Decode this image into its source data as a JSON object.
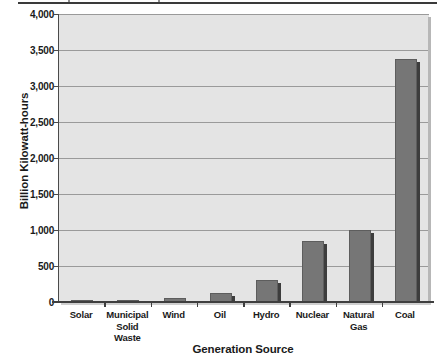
{
  "chart_data": {
    "type": "bar",
    "title": "",
    "xlabel": "Generation Source",
    "ylabel": "Billion Kilowatt-hours",
    "categories": [
      "Solar",
      "Municipal Solid Waste",
      "Wind",
      "Oil",
      "Hydro",
      "Nuclear",
      "Natural Gas",
      "Coal"
    ],
    "category_lines": [
      [
        "Solar"
      ],
      [
        "Municipal",
        "Solid Waste"
      ],
      [
        "Wind"
      ],
      [
        "Oil"
      ],
      [
        "Hydro"
      ],
      [
        "Nuclear"
      ],
      [
        "Natural Gas"
      ],
      [
        "Coal"
      ]
    ],
    "values": [
      2,
      25,
      55,
      130,
      300,
      850,
      1000,
      3380
    ],
    "ylim": [
      0,
      4000
    ],
    "ytick_values": [
      0,
      500,
      1000,
      1500,
      2000,
      2500,
      3000,
      3500,
      4000
    ],
    "ytick_labels": [
      "0",
      "500",
      "1,000",
      "1,500",
      "2,000",
      "2,500",
      "3,000",
      "3,500",
      "4,000"
    ],
    "grid": true,
    "legend": "none",
    "bar_color": "#767676",
    "bar_edge_color": "#5d5d5d",
    "bar_shadow_color": "#3d3d3d",
    "plot_background": "#e4e4e4",
    "gridline_color": "#9a9a9a",
    "axis_color": "#3f3f3f",
    "page_background": "#ffffff"
  }
}
